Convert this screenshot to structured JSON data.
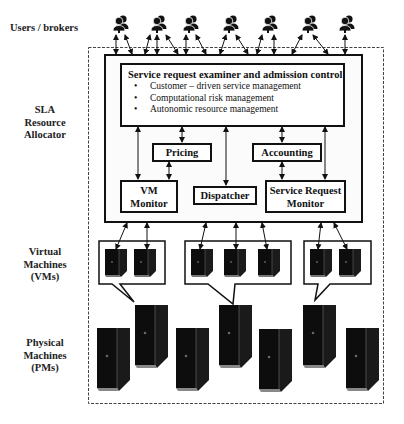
{
  "labels": {
    "users": "Users / brokers",
    "sla_1": "SLA",
    "sla_2": "Resource",
    "sla_3": "Allocator",
    "vms_1": "Virtual",
    "vms_2": "Machines",
    "vms_3": "(VMs)",
    "pms_1": "Physical",
    "pms_2": "Machines",
    "pms_3": "(PMs)"
  },
  "examiner": {
    "title": "Service request examiner and admission control",
    "items": [
      "Customer – driven service management",
      "Computational risk management",
      "Autonomic resource management"
    ]
  },
  "components": {
    "pricing": "Pricing",
    "accounting": "Accounting",
    "vm_monitor_1": "VM",
    "vm_monitor_2": "Monitor",
    "dispatcher": "Dispatcher",
    "srm_1": "Service Request",
    "srm_2": "Monitor"
  },
  "icons": {
    "user": "user-pair-icon",
    "server": "server-tower-icon"
  },
  "counts": {
    "user_groups": 7,
    "vm_groups": [
      2,
      3,
      2
    ],
    "physical_machines": 7
  }
}
